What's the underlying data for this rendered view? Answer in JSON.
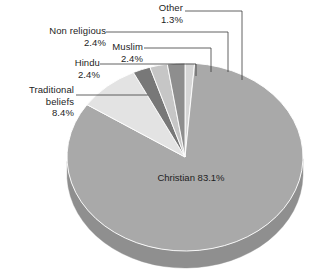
{
  "chart_data": {
    "type": "pie",
    "title": "",
    "subtitle": "",
    "xlabel": "",
    "ylabel": "",
    "legend_position": "none",
    "grid": false,
    "style": "3d-pie",
    "units": "percent",
    "categories": [
      "Christian",
      "Traditional beliefs",
      "Hindu",
      "Muslim",
      "Non religious",
      "Other"
    ],
    "values": [
      83.1,
      8.4,
      2.4,
      2.4,
      2.4,
      1.3
    ],
    "labels": [
      "83.1%",
      "8.4%",
      "2.4%",
      "2.4%",
      "2.4%",
      "1.3%"
    ],
    "colors": [
      "#a9a9a9",
      "#e3e3e3",
      "#787878",
      "#c6c6c6",
      "#8e8e8e",
      "#d6d6d6"
    ],
    "slices": [
      {
        "name": "Christian",
        "value": 83.1,
        "label": "Christian",
        "pct": "83.1%",
        "color": "#a9a9a9",
        "side_color": "#8f8f8f",
        "label_placement": "inside"
      },
      {
        "name": "Traditional beliefs",
        "value": 8.4,
        "label": "Traditional beliefs",
        "pct": "8.4%",
        "color": "#e3e3e3",
        "side_color": "#c2c2c2",
        "label_placement": "callout"
      },
      {
        "name": "Hindu",
        "value": 2.4,
        "label": "Hindu",
        "pct": "2.4%",
        "color": "#787878",
        "side_color": "#646464",
        "label_placement": "callout"
      },
      {
        "name": "Muslim",
        "value": 2.4,
        "label": "Muslim",
        "pct": "2.4%",
        "color": "#c6c6c6",
        "side_color": "#a8a8a8",
        "label_placement": "callout"
      },
      {
        "name": "Non religious",
        "value": 2.4,
        "label": "Non religious",
        "pct": "2.4%",
        "color": "#8e8e8e",
        "side_color": "#787878",
        "label_placement": "callout"
      },
      {
        "name": "Other",
        "value": 1.3,
        "label": "Other",
        "pct": "1.3%",
        "color": "#d6d6d6",
        "side_color": "#b6b6b6",
        "label_placement": "callout"
      }
    ]
  },
  "callouts": {
    "other": {
      "label": "Other",
      "pct": "1.3%"
    },
    "nonreligious": {
      "label": "Non religious",
      "pct": "2.4%"
    },
    "muslim": {
      "label": "Muslim",
      "pct": "2.4%"
    },
    "hindu": {
      "label": "Hindu",
      "pct": "2.4%"
    },
    "traditional": {
      "label_line1": "Traditional",
      "label_line2": "beliefs",
      "pct": "8.4%"
    },
    "christian": {
      "label": "Christian",
      "pct": "83.1%"
    }
  },
  "geometry": {
    "center_x": 185,
    "center_y": 157,
    "radius_x": 118,
    "radius_y": 94,
    "depth": 17,
    "start_angle_deg": -90
  }
}
